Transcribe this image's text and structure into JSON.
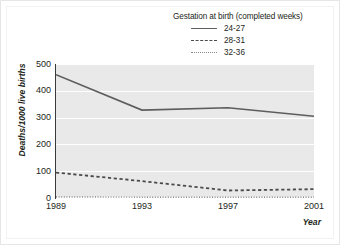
{
  "legend": {
    "title": "Gestation at birth (completed weeks)",
    "entries": [
      {
        "label": "24-27",
        "style": "solid"
      },
      {
        "label": "28-31",
        "style": "dashed"
      },
      {
        "label": "32-36",
        "style": "dotted"
      }
    ]
  },
  "axes": {
    "ylabel": "Deaths/1000 live births",
    "xlabel": "Year",
    "yticks": [
      "0",
      "100",
      "200",
      "300",
      "400",
      "500"
    ],
    "xticks": [
      "1989",
      "1993",
      "1997",
      "2001"
    ]
  },
  "colors": {
    "plot_background": "#e9e9e9",
    "gridline": "#ffffff",
    "series_24_27": "#5d5d5d",
    "series_28_31": "#4a4a4a",
    "series_32_36": "#8a8a8a",
    "axis": "#3a3a3a",
    "text": "#231f20"
  },
  "chart_data": {
    "type": "line",
    "title": "",
    "xlabel": "Year",
    "ylabel": "Deaths/1000 live births",
    "x": [
      1989,
      1993,
      1997,
      2001
    ],
    "categories": [
      "1989",
      "1993",
      "1997",
      "2001"
    ],
    "xlim": [
      1989,
      2001
    ],
    "ylim": [
      0,
      500
    ],
    "yticks": [
      0,
      100,
      200,
      300,
      400,
      500
    ],
    "grid": "horizontal",
    "legend_position": "top-right",
    "legend_title": "Gestation at birth (completed weeks)",
    "series": [
      {
        "name": "24-27",
        "linestyle": "solid",
        "values": [
          460,
          328,
          337,
          305
        ]
      },
      {
        "name": "28-31",
        "linestyle": "dashed",
        "values": [
          95,
          63,
          28,
          33
        ]
      },
      {
        "name": "32-36",
        "linestyle": "dotted",
        "values": [
          4,
          3,
          3,
          3
        ]
      }
    ]
  }
}
